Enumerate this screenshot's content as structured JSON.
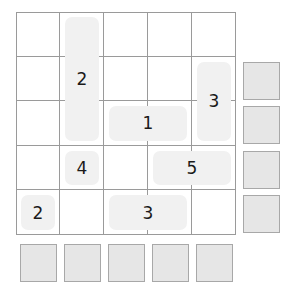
{
  "puzzle": {
    "rows": 5,
    "cols": 5,
    "pieces": [
      {
        "label": "2",
        "row": 1,
        "col": 2,
        "row_span": 3,
        "col_span": 1
      },
      {
        "label": "3",
        "row": 2,
        "col": 5,
        "row_span": 2,
        "col_span": 1
      },
      {
        "label": "1",
        "row": 3,
        "col": 3,
        "row_span": 1,
        "col_span": 2
      },
      {
        "label": "4",
        "row": 4,
        "col": 2,
        "row_span": 1,
        "col_span": 1
      },
      {
        "label": "5",
        "row": 4,
        "col": 4,
        "row_span": 1,
        "col_span": 2
      },
      {
        "label": "2",
        "row": 5,
        "col": 1,
        "row_span": 1,
        "col_span": 1
      },
      {
        "label": "3",
        "row": 5,
        "col": 3,
        "row_span": 1,
        "col_span": 2
      }
    ],
    "right_clue_rows": [
      2,
      3,
      4,
      5
    ],
    "bottom_clue_cols": [
      1,
      2,
      3,
      4,
      5
    ]
  },
  "colors": {
    "grid_line": "#9a9a9a",
    "piece_fill": "#f1f1f1",
    "clue_box_fill": "#e6e6e6",
    "clue_box_border": "#a8a8a8",
    "text": "#1a1a1a"
  }
}
